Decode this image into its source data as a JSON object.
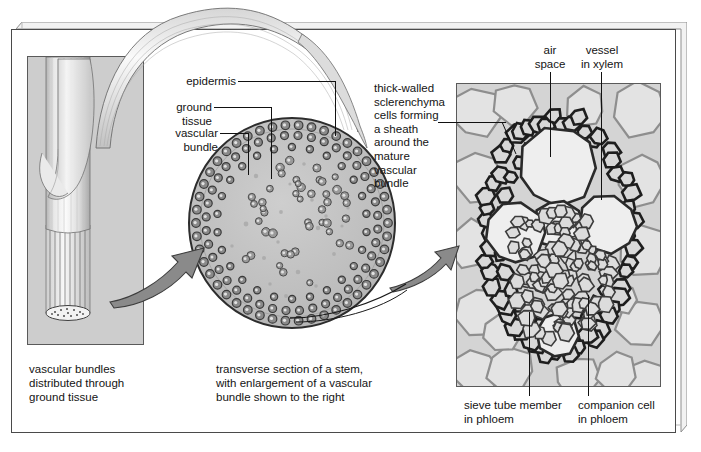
{
  "figure": {
    "type": "biology-anatomy-diagram"
  },
  "panels": {
    "stem": {
      "name": "whole stem with leaf sheath illustration"
    },
    "section": {
      "name": "transverse section of stem (circular drawing)"
    },
    "micrograph": {
      "name": "light micrograph of one vascular bundle"
    }
  },
  "labels": {
    "epidermis": "epidermis",
    "ground_tissue": "ground\ntissue",
    "vascular_bundle": "vascular\nbundle",
    "sclerenchyma": "thick-walled\nsclerenchyma\ncells forming\na sheath\naround the\nmature\nvascular\nbundle",
    "air_space": "air\nspace",
    "vessel_in_xylem": "vessel\nin xylem",
    "sieve_tube": "sieve tube member\nin phloem",
    "companion_cell": "companion cell\nin phloem"
  },
  "captions": {
    "left": "vascular bundles\ndistributed through\nground tissue",
    "center": "transverse section of a stem,\nwith enlargement of a vascular\nbundle shown to the right"
  },
  "colors": {
    "frame_line": "#4a4a4a",
    "panel_line": "#5a5a5a",
    "leader_line": "#111111",
    "arrow_fill": "#8a8a8a",
    "arrow_stroke": "#3c3c3c",
    "section_fill": "#b9b9b9",
    "section_rim": "#8f8f8f",
    "bundle_dot": "#6b6b6b",
    "micrograph_bg": "#d2d2d2",
    "micrograph_cell_wall": "#2e2e2e",
    "text": "#141414"
  }
}
